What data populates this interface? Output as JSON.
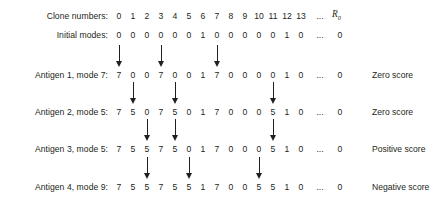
{
  "figure": {
    "column_count": 14,
    "ellipsis": "...",
    "r_symbol": "R",
    "r_subscript": "0"
  },
  "rows": [
    {
      "label": "Clone numbers:",
      "values": [
        "0",
        "1",
        "2",
        "3",
        "4",
        "5",
        "6",
        "7",
        "8",
        "9",
        "10",
        "11",
        "12",
        "13"
      ],
      "tail": "...",
      "last": "",
      "arrows": [],
      "score": ""
    },
    {
      "label": "Initial modes:",
      "values": [
        "0",
        "0",
        "0",
        "0",
        "0",
        "0",
        "1",
        "0",
        "0",
        "0",
        "0",
        "0",
        "1",
        "0"
      ],
      "tail": "...",
      "last": "0",
      "arrows": [],
      "score": ""
    },
    {
      "label": "Antigen 1, mode 7:",
      "values": [
        "7",
        "0",
        "0",
        "7",
        "0",
        "0",
        "1",
        "7",
        "0",
        "0",
        "0",
        "0",
        "1",
        "0"
      ],
      "tail": "...",
      "last": "0",
      "arrows": [
        0,
        3,
        7
      ],
      "score": "Zero score"
    },
    {
      "label": "Antigen 2, mode 5:",
      "values": [
        "7",
        "5",
        "0",
        "7",
        "5",
        "0",
        "1",
        "7",
        "0",
        "0",
        "0",
        "5",
        "1",
        "0"
      ],
      "tail": "...",
      "last": "0",
      "arrows": [
        1,
        4,
        11
      ],
      "score": "Zero score"
    },
    {
      "label": "Antigen 3, mode 5:",
      "values": [
        "7",
        "5",
        "5",
        "7",
        "5",
        "0",
        "1",
        "7",
        "0",
        "0",
        "0",
        "5",
        "1",
        "0"
      ],
      "tail": "...",
      "last": "0",
      "arrows": [
        2,
        4,
        11
      ],
      "score": "Positive score"
    },
    {
      "label": "Antigen 4, mode 9:",
      "values": [
        "7",
        "5",
        "5",
        "7",
        "5",
        "5",
        "1",
        "7",
        "0",
        "0",
        "5",
        "5",
        "1",
        "0"
      ],
      "tail": "...",
      "last": "0",
      "arrows": [
        2,
        5,
        10
      ],
      "score": "Negative score"
    }
  ],
  "colors": {
    "ink": "#231f20",
    "background": "#ffffff"
  }
}
